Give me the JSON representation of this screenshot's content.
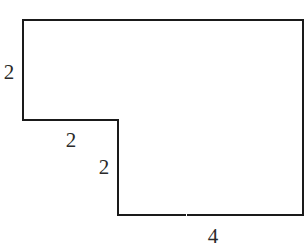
{
  "diagram": {
    "title": "",
    "shape": "L-shaped polygon (rectangle with lower-left corner removed)",
    "vertices": [
      {
        "x": 23,
        "y": 20
      },
      {
        "x": 303,
        "y": 20
      },
      {
        "x": 303,
        "y": 215
      },
      {
        "x": 118,
        "y": 215
      },
      {
        "x": 118,
        "y": 120
      },
      {
        "x": 23,
        "y": 120
      }
    ],
    "edge_color": "#1a1a1a",
    "labels": [
      {
        "id": "left-side",
        "text": "2",
        "x": 9,
        "y": 72
      },
      {
        "id": "step-horizontal",
        "text": "2",
        "x": 71,
        "y": 140
      },
      {
        "id": "step-vertical",
        "text": "2",
        "x": 104,
        "y": 167
      },
      {
        "id": "bottom-side",
        "text": "4",
        "x": 213,
        "y": 236
      }
    ]
  }
}
